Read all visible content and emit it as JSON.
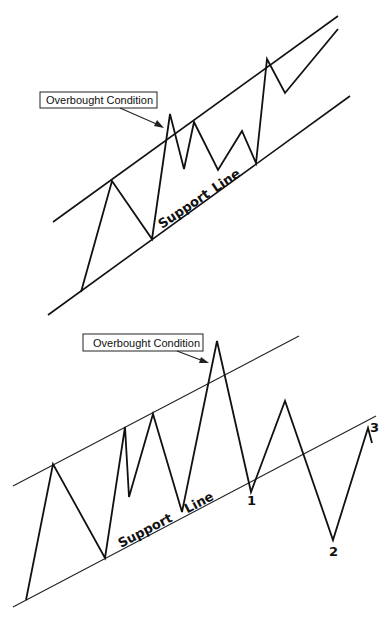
{
  "diagrams": [
    {
      "id": "top",
      "callout": {
        "label": "Overbought Condition",
        "box": [
          40,
          92,
          117,
          16
        ],
        "arrow_from": [
          120,
          108
        ],
        "arrow_to": [
          163,
          127
        ]
      },
      "support_label": {
        "word1": "Support",
        "word2": "Line"
      },
      "upper_line": [
        [
          53,
          222
        ],
        [
          338,
          16
        ]
      ],
      "lower_line": [
        [
          48,
          315
        ],
        [
          350,
          96
        ]
      ],
      "price_path": [
        [
          81,
          292
        ],
        [
          112,
          181
        ],
        [
          152,
          239
        ],
        [
          170,
          114
        ],
        [
          184,
          169
        ],
        [
          194,
          122
        ],
        [
          218,
          170
        ],
        [
          242,
          131
        ],
        [
          256,
          163
        ],
        [
          267,
          59
        ],
        [
          285,
          93
        ],
        [
          338,
          29
        ]
      ]
    },
    {
      "id": "bottom",
      "callout": {
        "label": "Overbought Condition",
        "box": [
          83,
          334,
          120,
          17
        ],
        "arrow_from": [
          177,
          351
        ],
        "arrow_to": [
          208,
          363
        ]
      },
      "support_label": {
        "word1": "Support",
        "word2": "Line"
      },
      "upper_line": [
        [
          13,
          486
        ],
        [
          299,
          336
        ]
      ],
      "lower_line": [
        [
          13,
          607
        ],
        [
          376,
          416
        ]
      ],
      "price_path": [
        [
          26,
          600
        ],
        [
          53,
          464
        ],
        [
          105,
          558
        ],
        [
          125,
          427
        ],
        [
          129,
          497
        ],
        [
          153,
          414
        ],
        [
          182,
          512
        ],
        [
          217,
          341
        ],
        [
          251,
          492
        ],
        [
          285,
          401
        ],
        [
          333,
          540
        ],
        [
          368,
          428
        ],
        [
          372,
          443
        ]
      ],
      "point_labels": [
        {
          "text": "1",
          "x": 251,
          "y": 504
        },
        {
          "text": "2",
          "x": 333,
          "y": 556
        },
        {
          "text": "3",
          "x": 374,
          "y": 431
        }
      ]
    }
  ],
  "colors": {
    "ink": "#111111",
    "background": "#ffffff"
  }
}
